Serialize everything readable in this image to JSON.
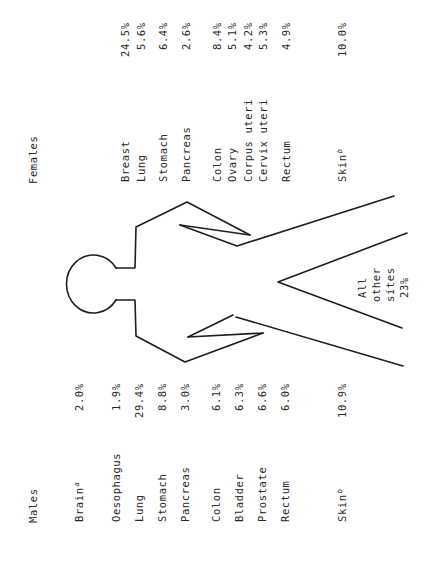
{
  "diagram": {
    "center_label": {
      "line1": "All",
      "line2": "other",
      "line3": "sites",
      "value": "23%"
    },
    "line_color": "#1e1e1e"
  },
  "males": {
    "title": "Males",
    "sites": [
      {
        "label": "Brain",
        "sup": "a",
        "value": "2.0%"
      },
      {
        "label": "Oesophagus",
        "sup": "",
        "value": "1.9%"
      },
      {
        "label": "Lung",
        "sup": "",
        "value": "29.4%"
      },
      {
        "label": "Stomach",
        "sup": "",
        "value": "8.8%"
      },
      {
        "label": "Pancreas",
        "sup": "",
        "value": "3.0%"
      },
      {
        "label": "Colon",
        "sup": "",
        "value": "6.1%"
      },
      {
        "label": "Bladder",
        "sup": "",
        "value": "6.3%"
      },
      {
        "label": "Prostate",
        "sup": "",
        "value": "6.6%"
      },
      {
        "label": "Rectum",
        "sup": "",
        "value": "6.0%"
      },
      {
        "label": "Skin",
        "sup": "b",
        "value": "10.9%"
      }
    ]
  },
  "females": {
    "title": "Females",
    "sites": [
      {
        "label": "Breast",
        "sup": "",
        "value": "24.5%"
      },
      {
        "label": "Lung",
        "sup": "",
        "value": "5.6%"
      },
      {
        "label": "Stomach",
        "sup": "",
        "value": "6.4%"
      },
      {
        "label": "Pancreas",
        "sup": "",
        "value": "2.6%"
      },
      {
        "label": "Colon",
        "sup": "",
        "value": "8.4%"
      },
      {
        "label": "Ovary",
        "sup": "",
        "value": "5.1%"
      },
      {
        "label": "Corpus uteri",
        "sup": "",
        "value": "4.2%"
      },
      {
        "label": "Cervix uteri",
        "sup": "",
        "value": "5.3%"
      },
      {
        "label": "Rectum",
        "sup": "",
        "value": "4.9%"
      },
      {
        "label": "Skin",
        "sup": "b",
        "value": "10.0%"
      }
    ]
  }
}
